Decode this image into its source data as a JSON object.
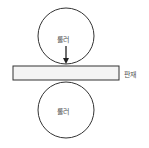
{
  "diagram": {
    "top_roller_label": "롤러",
    "bottom_roller_label": "롤러",
    "plate_label": "판재",
    "stroke_color": "#333333",
    "plate_fill": "#f4f4f4"
  }
}
